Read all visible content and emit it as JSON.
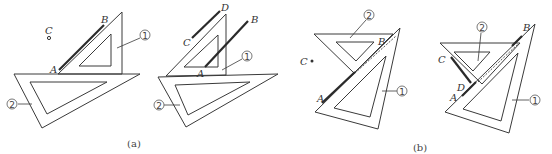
{
  "figure": {
    "panels": [
      {
        "id": "a",
        "caption": "(a)",
        "sub_figures": [
          {
            "points": {
              "A": "A",
              "B": "B",
              "C": "C"
            },
            "triangle_labels": {
              "t1": "①",
              "t2": "②"
            }
          },
          {
            "points": {
              "A": "A",
              "B": "B",
              "C": "C",
              "D": "D"
            },
            "triangle_labels": {
              "t1": "①",
              "t2": "②"
            }
          }
        ]
      },
      {
        "id": "b",
        "caption": "(b)",
        "sub_figures": [
          {
            "points": {
              "A": "A",
              "B": "B",
              "C": "C"
            },
            "triangle_labels": {
              "t1": "①",
              "t2": "②"
            }
          },
          {
            "points": {
              "A": "A",
              "B": "B",
              "C": "C",
              "D": "D"
            },
            "triangle_labels": {
              "t1": "①",
              "t2": "②"
            }
          }
        ]
      }
    ]
  }
}
